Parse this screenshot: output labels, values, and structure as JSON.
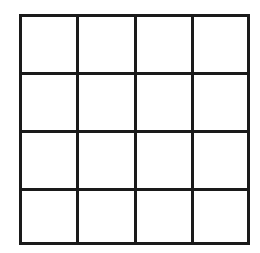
{
  "diagram": {
    "type": "grid",
    "rows": 4,
    "cols": 4,
    "cells": 16,
    "line_color": "#1a1a1a",
    "background": "#ffffff",
    "cell_contents": [
      [
        "",
        "",
        "",
        ""
      ],
      [
        "",
        "",
        "",
        ""
      ],
      [
        "",
        "",
        "",
        ""
      ],
      [
        "",
        "",
        "",
        ""
      ]
    ]
  }
}
